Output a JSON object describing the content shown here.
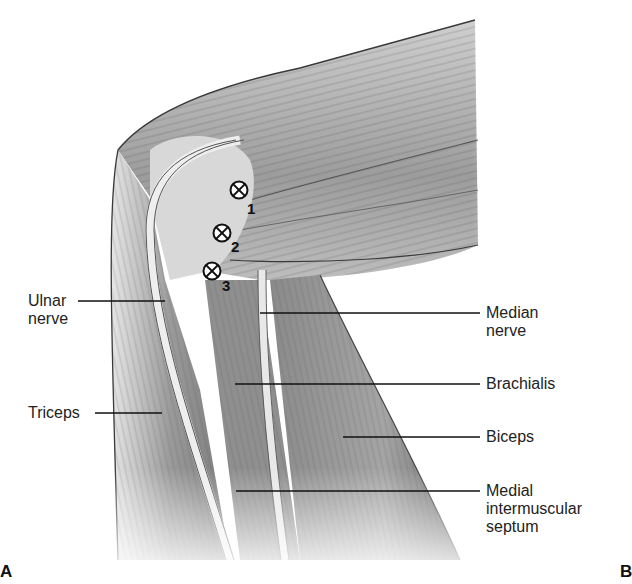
{
  "figure": {
    "type": "anatomical illustration",
    "panel_letters": {
      "left": "A",
      "right": "B"
    }
  },
  "markers": [
    {
      "number": "1",
      "symbol": "circle-x",
      "cx": 239,
      "cy": 190
    },
    {
      "number": "2",
      "symbol": "circle-x",
      "cx": 222,
      "cy": 233
    },
    {
      "number": "3",
      "symbol": "circle-x",
      "cx": 212,
      "cy": 271
    }
  ],
  "labels": {
    "left": [
      {
        "id": "ulnar-nerve",
        "lines": [
          "Ulnar",
          "nerve"
        ],
        "leader": {
          "x1": 78,
          "y1": 301,
          "x2": 165,
          "y2": 301
        }
      },
      {
        "id": "triceps",
        "lines": [
          "Triceps"
        ],
        "leader": {
          "x1": 95,
          "y1": 413,
          "x2": 162,
          "y2": 413
        }
      }
    ],
    "right": [
      {
        "id": "median-nerve",
        "lines": [
          "Median",
          "nerve"
        ],
        "leader": {
          "x1": 260,
          "y1": 313,
          "x2": 480,
          "y2": 313
        }
      },
      {
        "id": "brachialis",
        "lines": [
          "Brachialis"
        ],
        "leader": {
          "x1": 235,
          "y1": 384,
          "x2": 480,
          "y2": 384
        }
      },
      {
        "id": "biceps",
        "lines": [
          "Biceps"
        ],
        "leader": {
          "x1": 343,
          "y1": 437,
          "x2": 480,
          "y2": 437
        }
      },
      {
        "id": "medial-intermuscular-septum",
        "lines": [
          "Medial",
          "intermuscular",
          "septum"
        ],
        "leader": {
          "x1": 236,
          "y1": 491,
          "x2": 480,
          "y2": 491
        }
      }
    ]
  },
  "colors": {
    "background": "#ffffff",
    "muscle_light": "#d9d9d9",
    "muscle_mid": "#a8a8a8",
    "muscle_dark": "#6e6e6e",
    "outline": "#3a3a3a",
    "text": "#222222"
  }
}
